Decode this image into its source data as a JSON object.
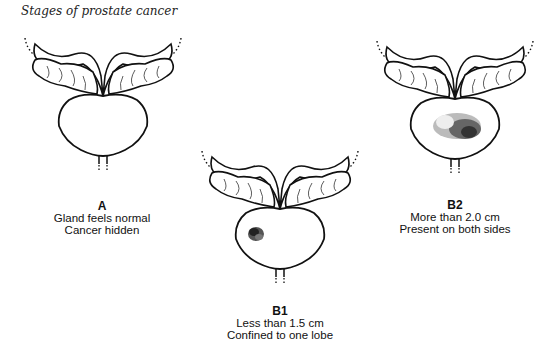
{
  "title": "Stages of prostate cancer",
  "stages": [
    {
      "id": "A",
      "label": "A",
      "line1": "Gland feels normal",
      "line2": "Cancer hidden",
      "tumor": "none"
    },
    {
      "id": "B1",
      "label": "B1",
      "line1": "Less than 1.5 cm",
      "line2": "Confined to one lobe",
      "tumor": "small"
    },
    {
      "id": "B2",
      "label": "B2",
      "line1": "More than 2.0 cm",
      "line2": "Present on both sides",
      "tumor": "large"
    }
  ]
}
